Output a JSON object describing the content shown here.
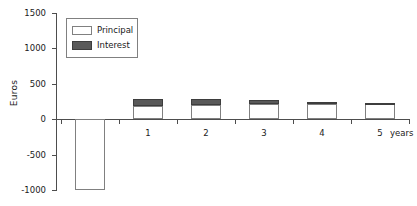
{
  "chart_data": {
    "type": "bar",
    "title": "",
    "subtitle": "",
    "xlabel": "years",
    "ylabel": "Euros",
    "stacked": true,
    "grid": false,
    "legend_position": "top-left",
    "categories": [
      "0",
      "1",
      "2",
      "3",
      "4",
      "5"
    ],
    "x_tick_labels": [
      "0",
      "1",
      "2",
      "3",
      "4",
      "5"
    ],
    "y_tick_labels": [
      "1500",
      "1000",
      "500",
      "0",
      "-500",
      "-1000"
    ],
    "y_tick_values": [
      1500,
      1000,
      500,
      0,
      -500,
      -1000
    ],
    "ylim": [
      -1000,
      1500
    ],
    "series": [
      {
        "name": "Principal",
        "color": "#ffffff",
        "edge_color": "#808080",
        "values": [
          -1000,
          185,
          195,
          205,
          215,
          210
        ]
      },
      {
        "name": "Interest",
        "color": "#595959",
        "edge_color": "#3d3d3d",
        "values": [
          0,
          100,
          85,
          60,
          30,
          10
        ]
      }
    ],
    "totals": [
      -1000,
      285,
      280,
      265,
      245,
      220
    ],
    "annotations": []
  },
  "axes": {
    "y_title": "Euros",
    "x_title": "years",
    "ticks_y": [
      {
        "label": "1500",
        "value": 1500
      },
      {
        "label": "1000",
        "value": 1000
      },
      {
        "label": "500",
        "value": 500
      },
      {
        "label": "0",
        "value": 0
      },
      {
        "label": "-500",
        "value": -500
      },
      {
        "label": "-1000",
        "value": -1000
      }
    ],
    "ticks_x": [
      {
        "label": "0"
      },
      {
        "label": "1"
      },
      {
        "label": "2"
      },
      {
        "label": "3"
      },
      {
        "label": "4"
      },
      {
        "label": "5"
      }
    ]
  },
  "legend": {
    "items": [
      {
        "label": "Principal",
        "swatch": "legend-swatch-principal"
      },
      {
        "label": "Interest",
        "swatch": "legend-swatch-interest"
      }
    ]
  },
  "colors": {
    "principal_fill": "#ffffff",
    "interest_fill": "#595959",
    "bar_edge": "#808080",
    "axis": "#4d4d4d",
    "text": "#1a1a1a",
    "background": "#ffffff"
  }
}
